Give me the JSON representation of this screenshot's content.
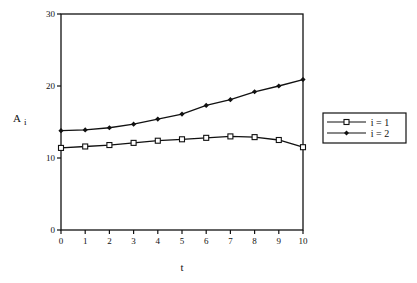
{
  "chart_data": {
    "type": "line",
    "title": "",
    "xlabel": "t",
    "ylabel": "A",
    "ylabel_subscript": "i",
    "xlim": [
      0,
      10
    ],
    "ylim": [
      0,
      30
    ],
    "x": [
      0,
      1,
      2,
      3,
      4,
      5,
      6,
      7,
      8,
      9,
      10
    ],
    "xticks": [
      "0",
      "1",
      "2",
      "3",
      "4",
      "5",
      "6",
      "7",
      "8",
      "9",
      "10"
    ],
    "yticks": [
      "0",
      "10",
      "20",
      "30"
    ],
    "grid": false,
    "legend_position": "right",
    "series": [
      {
        "name": "i = 1",
        "marker": "square",
        "values": [
          11.4,
          11.6,
          11.8,
          12.1,
          12.4,
          12.6,
          12.8,
          13.0,
          12.9,
          12.5,
          11.5
        ]
      },
      {
        "name": "i = 2",
        "marker": "diamond",
        "values": [
          13.8,
          13.9,
          14.2,
          14.7,
          15.4,
          16.1,
          17.3,
          18.1,
          19.2,
          20.0,
          20.9
        ]
      }
    ]
  }
}
